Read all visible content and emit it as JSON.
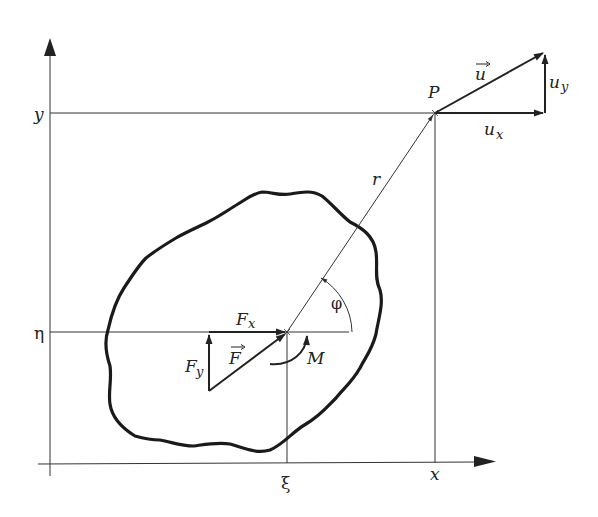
{
  "diagram": {
    "type": "mechanics-free-body",
    "axes": {
      "x_label": "x",
      "y_label": "y"
    },
    "coordinate_labels": {
      "eta": "η",
      "xi": "ξ",
      "y_level": "y",
      "x_level": "x"
    },
    "point": {
      "label": "P"
    },
    "vectors": {
      "radius": "r",
      "displacement": "u",
      "displacement_x": "u",
      "displacement_x_sub": "x",
      "displacement_y": "u",
      "displacement_y_sub": "y",
      "force": "F",
      "force_x": "F",
      "force_x_sub": "x",
      "force_y": "F",
      "force_y_sub": "y",
      "moment": "M",
      "angle": "φ"
    },
    "colors": {
      "ink": "#222222",
      "background": "#ffffff"
    }
  }
}
